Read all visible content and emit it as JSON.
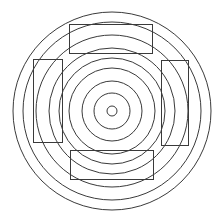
{
  "diagram": {
    "stroke_color": "#3a3a3a",
    "background": "#ffffff",
    "center": {
      "x": 112,
      "y": 111
    },
    "circle_radii": [
      5,
      18,
      30,
      43,
      53,
      63,
      76,
      89,
      99
    ],
    "rectangles": [
      {
        "name": "top-rectangle",
        "x": 69,
        "y": 24,
        "w": 83,
        "h": 29
      },
      {
        "name": "left-rectangle",
        "x": 33,
        "y": 59,
        "w": 29,
        "h": 83
      },
      {
        "name": "right-rectangle",
        "x": 161,
        "y": 60,
        "w": 27,
        "h": 85
      },
      {
        "name": "bottom-rectangle",
        "x": 70,
        "y": 150,
        "w": 83,
        "h": 29
      }
    ]
  }
}
